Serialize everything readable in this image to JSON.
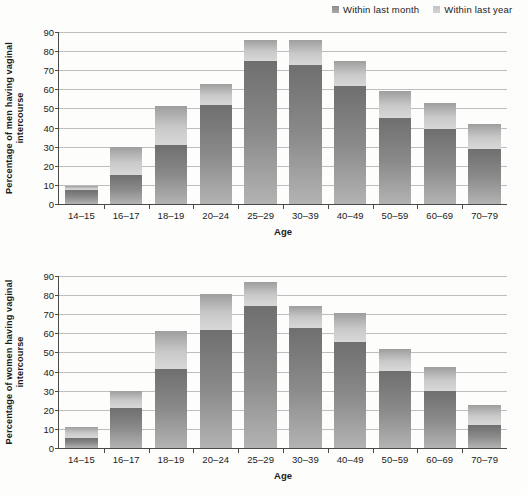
{
  "legend": {
    "items": [
      {
        "label": "Within last month",
        "key": "month",
        "color": "#8a8a8a"
      },
      {
        "label": "Within last year",
        "key": "year",
        "color": "#cccccc"
      }
    ]
  },
  "axis": {
    "yticks": [
      0,
      10,
      20,
      30,
      40,
      50,
      60,
      70,
      80,
      90
    ],
    "ylim": [
      0,
      90
    ],
    "xlabel": "Age"
  },
  "chart_data": [
    {
      "type": "bar",
      "stacked": true,
      "panel": "men",
      "title": "",
      "ylabel": "Percentage of men having vaginal intercourse",
      "xlabel": "Age",
      "categories": [
        "14–15",
        "16–17",
        "18–19",
        "20–24",
        "25–29",
        "30–39",
        "40–49",
        "50–59",
        "60–69",
        "70–79"
      ],
      "series": [
        {
          "name": "Within last month",
          "values": [
            7.5,
            15,
            31,
            52,
            75,
            73,
            61.5,
            45,
            39,
            29
          ]
        },
        {
          "name": "Within last year",
          "values": [
            9.5,
            30,
            51.5,
            63,
            86,
            86,
            75,
            59,
            53,
            42
          ]
        }
      ],
      "ylim": [
        0,
        90
      ],
      "grid": true,
      "legend_position": "top-right"
    },
    {
      "type": "bar",
      "stacked": true,
      "panel": "women",
      "title": "",
      "ylabel": "Percentage of women having vaginal intercourse",
      "xlabel": "Age",
      "categories": [
        "14–15",
        "16–17",
        "18–19",
        "20–24",
        "25–29",
        "30–39",
        "40–49",
        "50–59",
        "60–69",
        "70–79"
      ],
      "series": [
        {
          "name": "Within last month",
          "values": [
            5.5,
            21,
            41.5,
            62,
            74.5,
            63,
            55.5,
            40.5,
            30,
            12
          ]
        },
        {
          "name": "Within last year",
          "values": [
            11,
            30,
            61,
            80.5,
            87,
            74.5,
            70.5,
            52,
            42.5,
            22.5
          ]
        }
      ],
      "ylim": [
        0,
        90
      ],
      "grid": true,
      "legend_position": "top-right"
    }
  ]
}
